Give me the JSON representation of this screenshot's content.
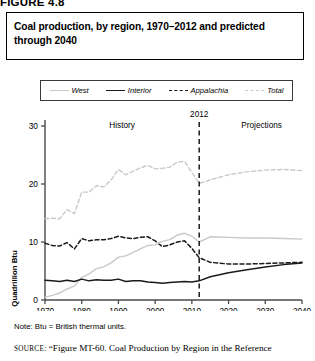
{
  "figure": {
    "label": "FIGURE 4.8",
    "title": "Coal production, by region, 1970–2012 and predicted through 2040"
  },
  "legend": {
    "position": "top",
    "items": [
      {
        "label": "West",
        "style": "solid",
        "color": "#c9c9c9",
        "swatch": "sw-solid-gray"
      },
      {
        "label": "Interior",
        "style": "solid",
        "color": "#1a1a1a",
        "swatch": "sw-solid-black"
      },
      {
        "label": "Appalachia",
        "style": "dashed",
        "color": "#1a1a1a",
        "swatch": "sw-dash-black"
      },
      {
        "label": "Total",
        "style": "dashed",
        "color": "#c9c9c9",
        "swatch": "sw-dash-gray"
      }
    ]
  },
  "annotations": {
    "history": "History",
    "divider_year": "2012",
    "projections": "Projections"
  },
  "note": "Note: Btu = British thermal units.",
  "source": {
    "prefix": "SOURCE:",
    "text": "“Figure MT-60. Coal Production by Region in the Reference"
  },
  "chart_data": {
    "type": "line",
    "title": "Coal production, by region, 1970–2012 and predicted through 2040",
    "xlabel": "",
    "ylabel": "Quadrillion Btu",
    "xlim": [
      1970,
      2040
    ],
    "ylim": [
      0,
      30
    ],
    "yticks": [
      0,
      10,
      20,
      30
    ],
    "xticks": [
      1970,
      1980,
      1990,
      2000,
      2010,
      2020,
      2030,
      2040
    ],
    "grid": false,
    "legend_position": "top",
    "divider_x": 2012,
    "divider_label": "2012",
    "region_labels": {
      "left": "History",
      "right": "Projections"
    },
    "series": [
      {
        "name": "Total",
        "color": "#c9c9c9",
        "style": "dashed",
        "x": [
          1970,
          1972,
          1974,
          1976,
          1978,
          1980,
          1982,
          1984,
          1986,
          1988,
          1990,
          1992,
          1994,
          1996,
          1998,
          2000,
          2002,
          2004,
          2006,
          2008,
          2010,
          2012,
          2015,
          2020,
          2025,
          2030,
          2035,
          2040
        ],
        "values": [
          14.0,
          14.1,
          14.0,
          15.6,
          14.9,
          18.6,
          18.6,
          19.7,
          19.5,
          20.7,
          22.5,
          21.6,
          22.2,
          22.8,
          23.2,
          22.6,
          22.7,
          22.9,
          23.8,
          23.9,
          22.0,
          20.1,
          20.7,
          21.6,
          22.1,
          22.4,
          22.5,
          22.3
        ]
      },
      {
        "name": "Appalachia",
        "color": "#1a1a1a",
        "style": "dashed",
        "x": [
          1970,
          1972,
          1974,
          1976,
          1978,
          1980,
          1982,
          1984,
          1986,
          1988,
          1990,
          1992,
          1994,
          1996,
          1998,
          2000,
          2002,
          2004,
          2006,
          2008,
          2010,
          2012,
          2015,
          2020,
          2025,
          2030,
          2035,
          2040
        ],
        "values": [
          9.8,
          9.4,
          9.3,
          9.9,
          8.8,
          10.6,
          10.2,
          10.4,
          10.4,
          10.6,
          11.0,
          10.7,
          10.6,
          10.8,
          10.9,
          10.2,
          9.2,
          9.5,
          10.0,
          10.2,
          8.9,
          7.3,
          6.5,
          6.2,
          6.2,
          6.3,
          6.4,
          6.5
        ]
      },
      {
        "name": "West",
        "color": "#c9c9c9",
        "style": "solid",
        "x": [
          1970,
          1972,
          1974,
          1976,
          1978,
          1980,
          1982,
          1984,
          1986,
          1988,
          1990,
          1992,
          1994,
          1996,
          1998,
          2000,
          2002,
          2004,
          2006,
          2008,
          2010,
          2012,
          2015,
          2020,
          2025,
          2030,
          2035,
          2040
        ],
        "values": [
          0.5,
          0.8,
          1.2,
          1.9,
          2.4,
          3.9,
          4.5,
          5.4,
          5.7,
          6.4,
          7.4,
          7.6,
          8.2,
          8.8,
          9.4,
          9.5,
          10.1,
          10.4,
          11.2,
          11.5,
          11.0,
          10.0,
          10.9,
          10.8,
          10.7,
          10.7,
          10.6,
          10.5
        ]
      },
      {
        "name": "Interior",
        "color": "#1a1a1a",
        "style": "solid",
        "x": [
          1970,
          1972,
          1974,
          1976,
          1978,
          1980,
          1982,
          1984,
          1986,
          1988,
          1990,
          1992,
          1994,
          1996,
          1998,
          2000,
          2002,
          2004,
          2006,
          2008,
          2010,
          2012,
          2015,
          2020,
          2025,
          2030,
          2035,
          2040
        ],
        "values": [
          3.4,
          3.3,
          3.2,
          3.4,
          3.2,
          3.6,
          3.3,
          3.5,
          3.4,
          3.4,
          3.6,
          3.2,
          3.3,
          3.3,
          3.1,
          3.0,
          2.9,
          3.0,
          3.1,
          3.2,
          3.1,
          3.3,
          4.0,
          4.7,
          5.2,
          5.7,
          6.1,
          6.4
        ]
      }
    ]
  }
}
